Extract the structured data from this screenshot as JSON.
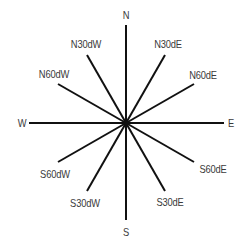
{
  "diagram": {
    "title": "",
    "center": {
      "x": 126,
      "y": 123
    },
    "line_color": "#111111",
    "label_color": "#3a3a3a",
    "directions": [
      {
        "label": "N",
        "x1": 126,
        "y1": 25,
        "lx": 126,
        "ly": 15
      },
      {
        "label": "N30dE",
        "x1": 165,
        "y1": 55,
        "lx": 168,
        "ly": 44
      },
      {
        "label": "N60dE",
        "x1": 194,
        "y1": 84,
        "lx": 203,
        "ly": 75
      },
      {
        "label": "E",
        "x1": 224,
        "y1": 123,
        "lx": 231,
        "ly": 123
      },
      {
        "label": "S60dE",
        "x1": 194,
        "y1": 162,
        "lx": 213,
        "ly": 169
      },
      {
        "label": "S30dE",
        "x1": 165,
        "y1": 191,
        "lx": 170,
        "ly": 202
      },
      {
        "label": "S",
        "x1": 126,
        "y1": 220,
        "lx": 126,
        "ly": 232
      },
      {
        "label": "S30dW",
        "x1": 87,
        "y1": 191,
        "lx": 85,
        "ly": 203
      },
      {
        "label": "S60dW",
        "x1": 58,
        "y1": 162,
        "lx": 55,
        "ly": 174
      },
      {
        "label": "W",
        "x1": 29,
        "y1": 123,
        "lx": 22,
        "ly": 123
      },
      {
        "label": "N60dW",
        "x1": 58,
        "y1": 84,
        "lx": 54,
        "ly": 74
      },
      {
        "label": "N30dW",
        "x1": 87,
        "y1": 55,
        "lx": 86,
        "ly": 44
      }
    ]
  }
}
